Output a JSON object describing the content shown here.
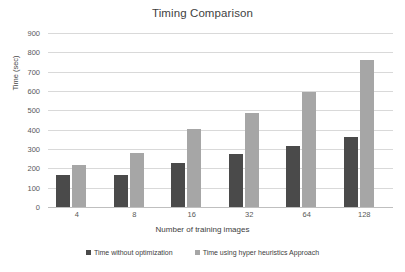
{
  "chart_data": {
    "type": "bar",
    "title": "Timing Comparison",
    "xlabel": "Number of training images",
    "ylabel": "Time (sec)",
    "categories": [
      "4",
      "8",
      "16",
      "32",
      "64",
      "128"
    ],
    "series": [
      {
        "name": "Time without optimization",
        "color": "#4a4a4a",
        "values": [
          166,
          168,
          228,
          275,
          316,
          362
        ]
      },
      {
        "name": "Time using hyper heuristics Approach",
        "color": "#a6a6a6",
        "values": [
          218,
          280,
          405,
          487,
          596,
          761
        ]
      }
    ],
    "ylim": [
      0,
      900
    ],
    "yticks": [
      0,
      100,
      200,
      300,
      400,
      500,
      600,
      700,
      800,
      900
    ],
    "grid": "horizontal",
    "legend_position": "bottom"
  }
}
